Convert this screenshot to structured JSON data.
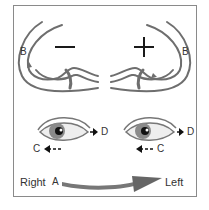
{
  "diagram": {
    "canals": {
      "left": {
        "sign": "−",
        "label": "B"
      },
      "right": {
        "sign": "+",
        "label": "B"
      }
    },
    "eyes": {
      "left_eye": {
        "forward_label": "D",
        "backward_label": "C"
      },
      "right_eye": {
        "forward_label": "D",
        "backward_label": "C"
      }
    },
    "rotation": {
      "start_label": "Right",
      "point_label": "A",
      "end_label": "Left"
    },
    "colors": {
      "line": "#6e6e6e",
      "iris": "#7a7a7a",
      "frame": "#8a8a8a",
      "text": "#333333"
    }
  }
}
